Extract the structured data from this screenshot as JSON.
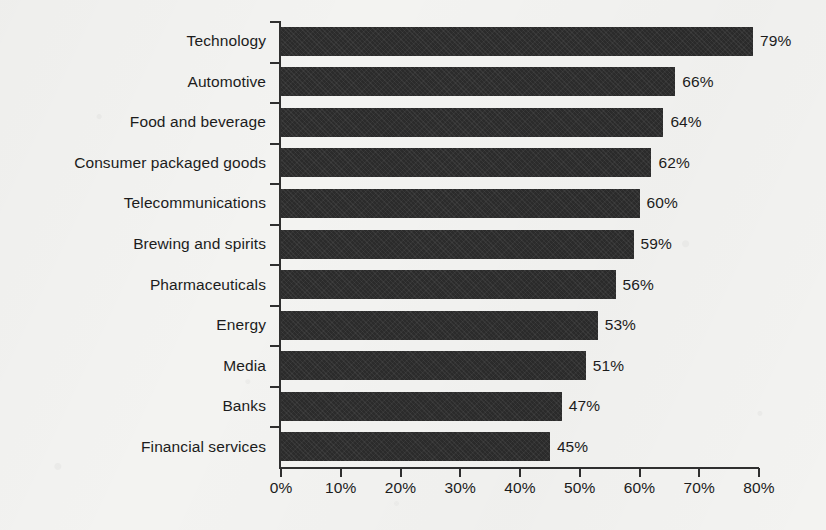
{
  "chart_data": {
    "type": "bar",
    "orientation": "horizontal",
    "title": "",
    "subtitle": "",
    "xlabel": "",
    "ylabel": "",
    "categories": [
      "Technology",
      "Automotive",
      "Food and beverage",
      "Consumer packaged goods",
      "Telecommunications",
      "Brewing and spirits",
      "Pharmaceuticals",
      "Energy",
      "Media",
      "Banks",
      "Financial services"
    ],
    "values": [
      79,
      66,
      64,
      62,
      60,
      59,
      56,
      53,
      51,
      47,
      45
    ],
    "value_labels": [
      "79%",
      "66%",
      "64%",
      "62%",
      "60%",
      "59%",
      "56%",
      "53%",
      "51%",
      "47%",
      "45%"
    ],
    "xlim": [
      0,
      80
    ],
    "xticks": [
      0,
      10,
      20,
      30,
      40,
      50,
      60,
      70,
      80
    ],
    "xtick_labels": [
      "0%",
      "10%",
      "20%",
      "30%",
      "40%",
      "50%",
      "60%",
      "70%",
      "80%"
    ],
    "grid": false,
    "legend": null,
    "bar_color": "#2b2b2b",
    "axis_color": "#2f2f2f",
    "background_color": "#f3f3f1",
    "text_color": "#1c1c1c"
  }
}
